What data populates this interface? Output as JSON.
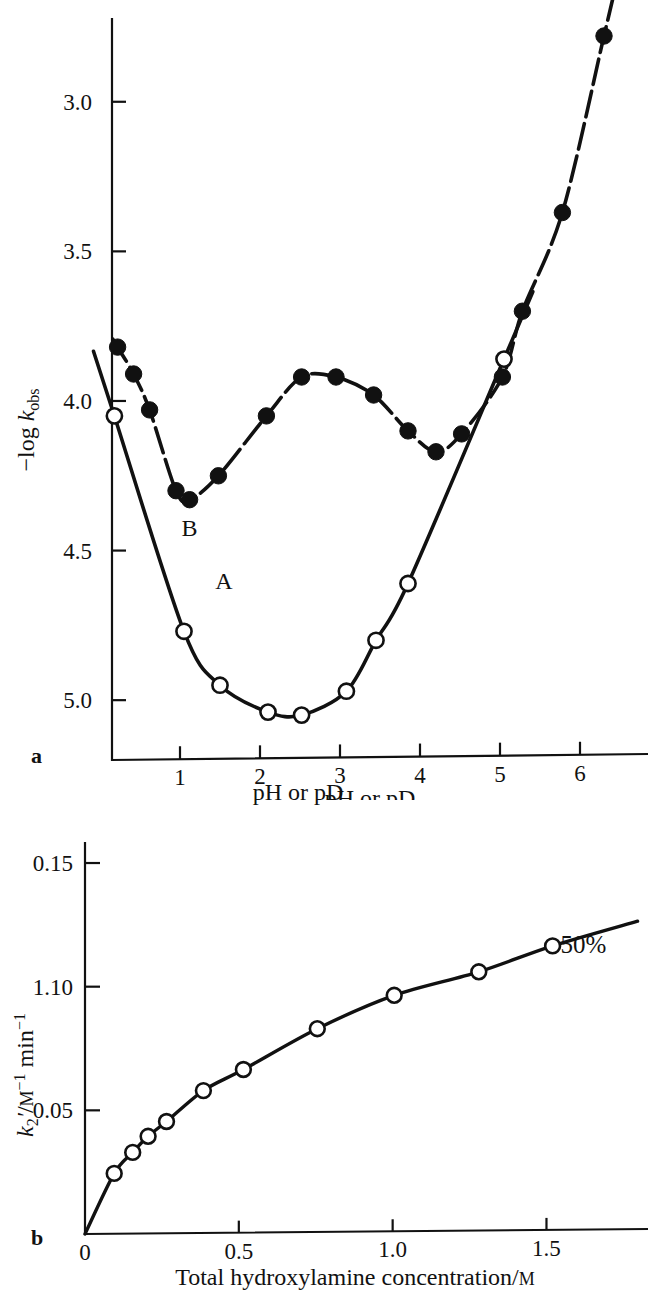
{
  "figure": {
    "panels": [
      {
        "id": "a",
        "letter": "a",
        "xaxis": {
          "title": "pH or  pD",
          "ticks": [
            1,
            2,
            3,
            4,
            5,
            6
          ],
          "ticklabels": [
            "1",
            "2",
            "3",
            "4",
            "5",
            "6"
          ],
          "min": 0.15,
          "max": 6.85
        },
        "yaxis": {
          "title_prefix": "−log ",
          "title_symbol": "k",
          "title_sub": "obs",
          "ticks": [
            3.0,
            3.5,
            4.0,
            4.5,
            5.0
          ],
          "ticklabels": [
            "3.0",
            "3.5",
            "4.0",
            "4.5",
            "5.0"
          ],
          "min": 2.72,
          "max": 5.2,
          "inverted": true
        },
        "curve_labels": [
          {
            "text": "A",
            "x": 1.55,
            "y": 4.63
          },
          {
            "text": "B",
            "x": 1.12,
            "y": 4.45
          }
        ]
      },
      {
        "id": "b",
        "letter": "b",
        "xaxis": {
          "title_text": "Total hydroxylamine concentration/",
          "title_unit": "M",
          "ticks": [
            0,
            0.5,
            1.0,
            1.5
          ],
          "ticklabels": [
            "0",
            "0.5",
            "1.0",
            "1.5"
          ],
          "min": 0,
          "max": 1.83
        },
        "yaxis": {
          "title_symbol": "k",
          "title_sub": "2",
          "title_prime": "′",
          "title_rest": "/",
          "title_unit": "M",
          "title_sup1": "−1",
          "title_mid": " min",
          "title_sup2": "−1",
          "ticks": [
            0.05,
            0.1,
            0.15
          ],
          "ticklabels": [
            "0.05",
            "1.10",
            "0.15"
          ],
          "min": 0,
          "max": 0.1585
        },
        "annotations": [
          {
            "text": "50%",
            "x": 1.62,
            "y": 0.1135
          }
        ]
      }
    ]
  },
  "chart_data": [
    {
      "type": "scatter",
      "panel": "a",
      "title": "",
      "xlabel": "pH or pD",
      "ylabel": "-log k_obs",
      "xlim": [
        0.15,
        6.85
      ],
      "ylim": [
        5.2,
        2.72
      ],
      "y_axis_inverted": true,
      "grid": false,
      "legend": "inline curve labels A and B",
      "series": [
        {
          "name": "A",
          "marker": "filled-circle",
          "line": "dashed",
          "points": [
            {
              "x": 0.22,
              "y": 3.82
            },
            {
              "x": 0.42,
              "y": 3.91
            },
            {
              "x": 0.62,
              "y": 4.03
            },
            {
              "x": 0.95,
              "y": 4.3
            },
            {
              "x": 1.12,
              "y": 4.33
            },
            {
              "x": 1.48,
              "y": 4.25
            },
            {
              "x": 2.08,
              "y": 4.05
            },
            {
              "x": 2.52,
              "y": 3.92
            },
            {
              "x": 2.95,
              "y": 3.92
            },
            {
              "x": 3.42,
              "y": 3.98
            },
            {
              "x": 3.85,
              "y": 4.1
            },
            {
              "x": 4.2,
              "y": 4.17
            },
            {
              "x": 4.52,
              "y": 4.11
            },
            {
              "x": 5.03,
              "y": 3.92
            },
            {
              "x": 5.28,
              "y": 3.7
            },
            {
              "x": 5.78,
              "y": 3.37
            },
            {
              "x": 6.3,
              "y": 2.78
            }
          ]
        },
        {
          "name": "B",
          "marker": "open-circle",
          "line": "solid",
          "points": [
            {
              "x": 0.18,
              "y": 4.05
            },
            {
              "x": 1.05,
              "y": 4.77
            },
            {
              "x": 1.5,
              "y": 4.95
            },
            {
              "x": 2.1,
              "y": 5.04
            },
            {
              "x": 2.52,
              "y": 5.05
            },
            {
              "x": 3.08,
              "y": 4.97
            },
            {
              "x": 3.45,
              "y": 4.8
            },
            {
              "x": 3.85,
              "y": 4.61
            },
            {
              "x": 5.05,
              "y": 3.86
            }
          ]
        }
      ]
    },
    {
      "type": "scatter",
      "panel": "b",
      "title": "",
      "xlabel": "Total hydroxylamine concentration/M",
      "ylabel": "k2'/M^-1 min^-1",
      "xlim": [
        0,
        1.83
      ],
      "ylim": [
        0,
        0.1585
      ],
      "grid": false,
      "annotation": "50%",
      "series": [
        {
          "name": "50%",
          "marker": "open-circle",
          "line": "solid",
          "points": [
            {
              "x": 0.095,
              "y": 0.0245
            },
            {
              "x": 0.155,
              "y": 0.033
            },
            {
              "x": 0.205,
              "y": 0.0395
            },
            {
              "x": 0.265,
              "y": 0.0455
            },
            {
              "x": 0.385,
              "y": 0.058
            },
            {
              "x": 0.515,
              "y": 0.0665
            },
            {
              "x": 0.755,
              "y": 0.083
            },
            {
              "x": 1.005,
              "y": 0.0965
            },
            {
              "x": 1.28,
              "y": 0.106
            },
            {
              "x": 1.52,
              "y": 0.1165
            }
          ]
        }
      ]
    }
  ]
}
